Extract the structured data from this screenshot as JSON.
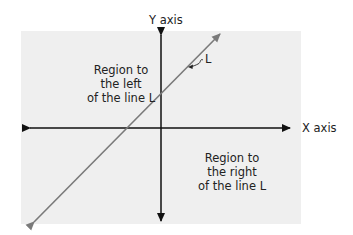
{
  "diagram": {
    "y_axis_label": "Y axis",
    "x_axis_label": "X axis",
    "line_label": "L",
    "left_region": {
      "line1": "Region to",
      "line2": "the left",
      "line3": "of the line L"
    },
    "right_region": {
      "line1": "Region to",
      "line2": "the right",
      "line3": "of the line L"
    },
    "colors": {
      "background": "#ffffff",
      "region_fill": "#efefef",
      "axes": "#111111",
      "line_L": "#7a7a7a"
    }
  }
}
